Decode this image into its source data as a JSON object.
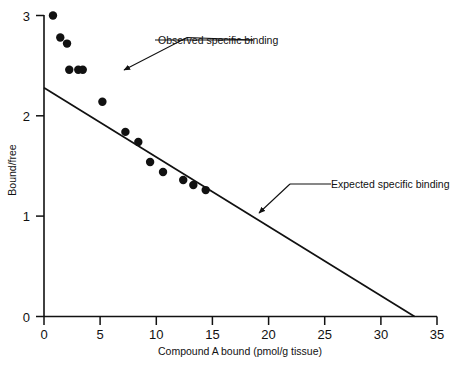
{
  "chart_data": {
    "type": "scatter",
    "title": "",
    "xlabel": "Compound A bound (pmol/g tissue)",
    "ylabel": "Bound/free",
    "xlim": [
      0,
      35
    ],
    "ylim": [
      0,
      3
    ],
    "xticks": [
      0,
      5,
      10,
      15,
      20,
      25,
      30,
      35
    ],
    "yticks": [
      0,
      1,
      2,
      3
    ],
    "xtick_labels": [
      "0",
      "5",
      "10",
      "15",
      "20",
      "25",
      "30",
      "35"
    ],
    "ytick_labels": [
      "0",
      "1",
      "2",
      "3"
    ],
    "grid": false,
    "legend": "none",
    "series": [
      {
        "name": "Observed specific binding",
        "type": "scatter",
        "marker": "filled-circle",
        "color": "#111111",
        "points": [
          [
            0.8,
            3.0
          ],
          [
            1.45,
            2.78
          ],
          [
            2.05,
            2.72
          ],
          [
            2.25,
            2.46
          ],
          [
            3.05,
            2.46
          ],
          [
            3.45,
            2.46
          ],
          [
            5.2,
            2.14
          ],
          [
            7.25,
            1.84
          ],
          [
            8.4,
            1.74
          ],
          [
            9.45,
            1.54
          ],
          [
            10.6,
            1.44
          ],
          [
            12.4,
            1.36
          ],
          [
            13.3,
            1.31
          ],
          [
            14.4,
            1.26
          ]
        ]
      },
      {
        "name": "Expected specific binding",
        "type": "line",
        "color": "#111111",
        "points": [
          [
            0,
            2.28
          ],
          [
            33.0,
            0
          ]
        ]
      }
    ],
    "annotations": [
      {
        "label": "Observed specific binding",
        "text_x": 158,
        "text_y": 44,
        "leader": "M 260,40 L 155,40 M 260,40 L 187,38 L 120,70"
      },
      {
        "label": "Expected specific binding",
        "text_x": 331,
        "text_y": 188,
        "leader": "M 288,184 L 328,184 M 288,184 L 258,214"
      }
    ]
  },
  "axes": {
    "x_axis_title": "Compound A bound (pmol/g tissue)",
    "y_axis_title": "Bound/free"
  }
}
